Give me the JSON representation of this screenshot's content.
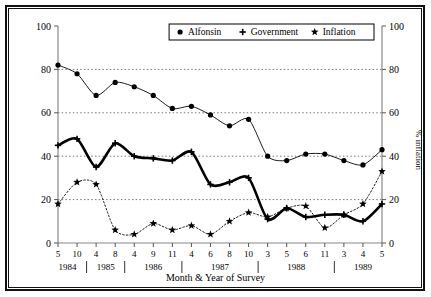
{
  "chart_data": {
    "type": "line",
    "title": "",
    "xlabel": "Month & Year of Survey",
    "ylabel": "% positive evaluations",
    "ylabel_right": "% inflation",
    "ylim": [
      0,
      100
    ],
    "yticks": [
      0,
      20,
      40,
      60,
      80,
      100
    ],
    "yticks_right": [
      0,
      20,
      40,
      60,
      80,
      100
    ],
    "grid": true,
    "grid_style": "dotted",
    "legend_position": "top-right",
    "categories": [
      "5",
      "10",
      "4",
      "8",
      "4",
      "9",
      "11",
      "4",
      "6",
      "8",
      "10",
      "3",
      "5",
      "6",
      "11",
      "3",
      "4",
      "5"
    ],
    "year_groups": [
      {
        "year": "1984",
        "start_index": 0,
        "end_index": 1
      },
      {
        "year": "1985",
        "start_index": 2,
        "end_index": 3
      },
      {
        "year": "1986",
        "start_index": 4,
        "end_index": 6
      },
      {
        "year": "1987",
        "start_index": 7,
        "end_index": 10
      },
      {
        "year": "1988",
        "start_index": 11,
        "end_index": 14
      },
      {
        "year": "1989",
        "start_index": 15,
        "end_index": 17
      }
    ],
    "series": [
      {
        "name": "Alfonsin",
        "marker": "dot",
        "line": "solid-thin",
        "values": [
          82,
          78,
          68,
          74,
          72,
          68,
          62,
          63,
          59,
          54,
          57,
          40,
          38,
          41,
          41,
          38,
          36,
          43
        ]
      },
      {
        "name": "Government",
        "marker": "plus",
        "line": "solid-thick",
        "values": [
          45,
          48,
          35,
          46,
          40,
          39,
          38,
          42,
          27,
          28,
          30,
          11,
          16,
          12,
          13,
          13,
          10,
          18
        ]
      },
      {
        "name": "Inflation",
        "marker": "star",
        "line": "dotted",
        "values": [
          18,
          28,
          27,
          6,
          4,
          9,
          6,
          8,
          4,
          10,
          14,
          12,
          16,
          17,
          7,
          13,
          18,
          33
        ]
      }
    ]
  },
  "legend": {
    "items": [
      {
        "label": "Alfonsin",
        "marker": "dot"
      },
      {
        "label": "Government",
        "marker": "plus"
      },
      {
        "label": "Inflation",
        "marker": "star"
      }
    ]
  }
}
